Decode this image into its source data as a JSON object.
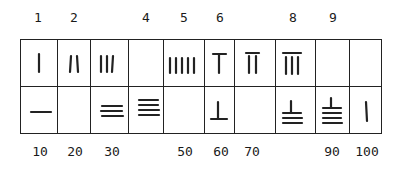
{
  "top_labels": [
    {
      "text": "1",
      "col": 0
    },
    {
      "text": "2",
      "col": 1
    },
    {
      "text": "4",
      "col": 3
    },
    {
      "text": "5",
      "col": 4
    },
    {
      "text": "6",
      "col": 5
    },
    {
      "text": "8",
      "col": 7
    },
    {
      "text": "9",
      "col": 8
    }
  ],
  "bottom_labels": [
    {
      "text": "10",
      "col": 0
    },
    {
      "text": "20",
      "col": 1
    },
    {
      "text": "30",
      "col": 2
    },
    {
      "text": "50",
      "col": 4
    },
    {
      "text": "60",
      "col": 5
    },
    {
      "text": "70",
      "col": 6
    },
    {
      "text": "90",
      "col": 8
    },
    {
      "text": "100",
      "col": 9
    }
  ],
  "units_row": [
    {
      "value": 1,
      "glyph": "1 vertical rod"
    },
    {
      "value": 2,
      "glyph": "2 vertical rods"
    },
    {
      "value": 3,
      "glyph": "3 vertical rods"
    },
    {
      "value": 4,
      "glyph": "empty"
    },
    {
      "value": 5,
      "glyph": "5 vertical rods"
    },
    {
      "value": 6,
      "glyph": "T (1 vertical + top bar)"
    },
    {
      "value": 7,
      "glyph": "2 vertical + top bar"
    },
    {
      "value": 8,
      "glyph": "3 vertical + top bar"
    },
    {
      "value": 9,
      "glyph": "empty"
    },
    {
      "value": null,
      "glyph": "empty"
    }
  ],
  "tens_row": [
    {
      "value": 10,
      "glyph": "1 horizontal rod"
    },
    {
      "value": 20,
      "glyph": "empty"
    },
    {
      "value": 30,
      "glyph": "3 horizontal rods"
    },
    {
      "value": 40,
      "glyph": "4 horizontal rods"
    },
    {
      "value": 50,
      "glyph": "empty"
    },
    {
      "value": 60,
      "glyph": "inverted T (1 horizontal + vertical)"
    },
    {
      "value": 70,
      "glyph": "empty"
    },
    {
      "value": 80,
      "glyph": "3 horizontal + vertical"
    },
    {
      "value": 90,
      "glyph": "4 horizontal + vertical"
    },
    {
      "value": 100,
      "glyph": "1 vertical rod"
    }
  ],
  "colors": {
    "ink": "#222222",
    "background": "#ffffff"
  }
}
